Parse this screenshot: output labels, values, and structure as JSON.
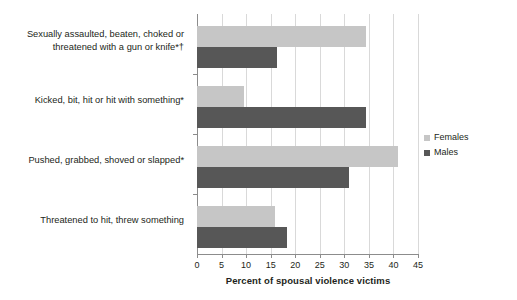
{
  "chart_data": {
    "type": "bar",
    "orientation": "horizontal",
    "title": "",
    "subtitle": "",
    "xlabel": "Percent of spousal violence victims",
    "ylabel": "",
    "xlim": [
      0,
      45
    ],
    "xticks": [
      0,
      5,
      10,
      15,
      20,
      25,
      30,
      35,
      40,
      45
    ],
    "xticklabels": [
      "0",
      "5",
      "10",
      "15",
      "20",
      "25",
      "30",
      "35",
      "40",
      "45"
    ],
    "grid": "vertical",
    "legend_position": "right",
    "categories": [
      "Sexually assaulted, beaten, choked or threatened with a gun or knife*†",
      "Kicked, bit, hit or hit with something*",
      "Pushed, grabbed, shoved or slapped*",
      "Threatened to hit, threw something"
    ],
    "series": [
      {
        "name": "Females",
        "color": "#c6c6c6",
        "values": [
          34.5,
          9.5,
          41.0,
          15.8
        ]
      },
      {
        "name": "Males",
        "color": "#575757",
        "values": [
          16.3,
          34.5,
          31.0,
          18.3
        ]
      }
    ]
  },
  "legend": {
    "items": [
      {
        "label": "Females",
        "color": "#c6c6c6"
      },
      {
        "label": "Males",
        "color": "#575757"
      }
    ]
  },
  "axis": {
    "x_title": "Percent of spousal violence victims"
  }
}
